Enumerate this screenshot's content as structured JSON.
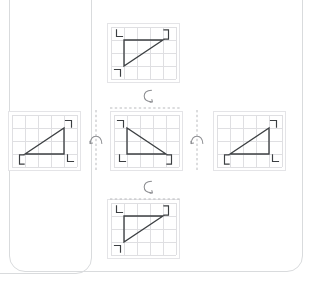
{
  "diagram": {
    "type": "geometry-transformation",
    "colors": {
      "shape_stroke": "#3c3f42",
      "grid_line": "#dfdfe2",
      "panel_border": "#e4e4e7",
      "axis_dash": "#b9babd",
      "arrow": "#8d8e92",
      "card_border": "#d9dbdd",
      "background": "#ffffff"
    },
    "grid": {
      "cols": 5,
      "rows": 4,
      "cell_px": 13
    },
    "panels": [
      {
        "id": "top",
        "name": "panel-top",
        "label": "Top panel — triangle rotated back about horizontal axis",
        "triangle": {
          "points": "1,1 1,3 4,1",
          "right_angle_vertex": "1,1"
        },
        "corner_marks": [
          {
            "id": "tl",
            "glyph": "L",
            "corner": "top-left"
          },
          {
            "id": "tr",
            "glyph": "E",
            "corner": "top-right"
          },
          {
            "id": "bl",
            "glyph": "7",
            "corner": "bottom-left"
          }
        ]
      },
      {
        "id": "left",
        "name": "panel-left",
        "label": "Left panel — triangle reflected about vertical axis",
        "triangle": {
          "points": "4,1 4,3 1,3",
          "right_angle_vertex": "4,3"
        },
        "corner_marks": [
          {
            "id": "tr",
            "glyph": "7",
            "corner": "top-right"
          },
          {
            "id": "bl",
            "glyph": "E",
            "corner": "bottom-left"
          },
          {
            "id": "br",
            "glyph": "L",
            "corner": "bottom-right"
          }
        ]
      },
      {
        "id": "center",
        "name": "panel-center",
        "label": "Center panel — original triangle",
        "triangle": {
          "points": "1,1 1,3 4,3",
          "right_angle_vertex": "1,3"
        },
        "corner_marks": [
          {
            "id": "tl",
            "glyph": "7",
            "corner": "top-left"
          },
          {
            "id": "bl",
            "glyph": "L",
            "corner": "bottom-left"
          },
          {
            "id": "br",
            "glyph": "E",
            "corner": "bottom-right"
          }
        ]
      },
      {
        "id": "right",
        "name": "panel-right",
        "label": "Right panel — triangle reflected about vertical axis",
        "triangle": {
          "points": "4,1 4,3 1,3",
          "right_angle_vertex": "4,3"
        },
        "corner_marks": [
          {
            "id": "tr",
            "glyph": "7",
            "corner": "top-right"
          },
          {
            "id": "bl",
            "glyph": "E",
            "corner": "bottom-left"
          },
          {
            "id": "br",
            "glyph": "L",
            "corner": "bottom-right"
          }
        ]
      },
      {
        "id": "bottom",
        "name": "panel-bottom",
        "label": "Bottom panel — triangle rotated forward about horizontal axis",
        "triangle": {
          "points": "1,1 1,3 4,1",
          "right_angle_vertex": "1,1"
        },
        "corner_marks": [
          {
            "id": "tl",
            "glyph": "L",
            "corner": "top-left"
          },
          {
            "id": "tr",
            "glyph": "E",
            "corner": "top-right"
          },
          {
            "id": "bl",
            "glyph": "7",
            "corner": "bottom-left"
          }
        ]
      }
    ],
    "axes": [
      {
        "id": "axis-horizontal-top",
        "name": "horizontal-rotation-axis-top",
        "orientation": "horizontal",
        "style": "dashed"
      },
      {
        "id": "axis-horizontal-bottom",
        "name": "horizontal-rotation-axis-bottom",
        "orientation": "horizontal",
        "style": "dashed"
      },
      {
        "id": "axis-vertical-left",
        "name": "vertical-rotation-axis-left",
        "orientation": "vertical",
        "style": "dashed"
      },
      {
        "id": "axis-vertical-right",
        "name": "vertical-rotation-axis-right",
        "orientation": "vertical",
        "style": "dashed"
      }
    ],
    "rotation_icons": [
      {
        "id": "rot-top",
        "name": "rotation-arrow-top",
        "about": "horizontal-axis",
        "shape": "curved-arrow-vertical"
      },
      {
        "id": "rot-bottom",
        "name": "rotation-arrow-bottom",
        "about": "horizontal-axis",
        "shape": "curved-arrow-vertical"
      },
      {
        "id": "rot-left",
        "name": "rotation-arrow-left",
        "about": "vertical-axis",
        "shape": "curved-arrow-horizontal"
      },
      {
        "id": "rot-right",
        "name": "rotation-arrow-right",
        "about": "vertical-axis",
        "shape": "curved-arrow-horizontal"
      }
    ]
  }
}
